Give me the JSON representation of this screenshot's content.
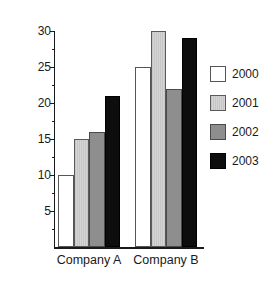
{
  "chart_data": {
    "type": "bar",
    "title": "",
    "xlabel": "",
    "ylabel": "Percentage Increase in Sales",
    "categories": [
      "Company A",
      "Company B"
    ],
    "series": [
      {
        "name": "2000",
        "values": [
          10,
          25
        ],
        "color": "#ffffff",
        "swatch": "white"
      },
      {
        "name": "2001",
        "values": [
          15,
          30
        ],
        "color": "#cbcbcb",
        "swatch": "light-gray-hatch"
      },
      {
        "name": "2002",
        "values": [
          16,
          22
        ],
        "color": "#8e8e8e",
        "swatch": "medium-gray"
      },
      {
        "name": "2003",
        "values": [
          21,
          29
        ],
        "color": "#0d0d0d",
        "swatch": "black"
      }
    ],
    "ylim": [
      0,
      30
    ],
    "ytick_labels": [
      "5",
      "10",
      "15",
      "20",
      "25",
      "30"
    ],
    "ytick_values": [
      5,
      10,
      15,
      20,
      25,
      30
    ],
    "yminor_values": [
      2.5,
      7.5,
      12.5,
      17.5,
      22.5,
      27.5
    ],
    "grid": false,
    "legend_position": "right",
    "legend_entries": [
      "2000",
      "2001",
      "2002",
      "2003"
    ]
  }
}
